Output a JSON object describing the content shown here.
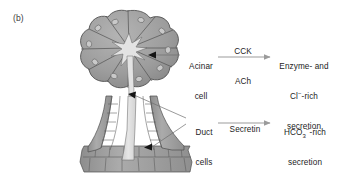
{
  "figure": {
    "panel_letter": "(b)",
    "diagram_title": "pancreatic-acinus-and-duct",
    "colors": {
      "acinus_fill": "#9a9a9a",
      "acinus_cell_fill": "#9e9e9e",
      "acinus_outline": "#4a4a4a",
      "nucleus_fill": "#c9c9c9",
      "lumen_fill": "#dedede",
      "duct_cell_fill": "#a5a5a5",
      "duct_outline": "#4f4f4f",
      "arrow_gray": "#9b9b9b",
      "leader_line": "#6e6e6e",
      "arrowhead_dark": "#151515",
      "text": "#1c1c1c",
      "background": "#ffffff"
    }
  },
  "labels": {
    "acinar_cell": {
      "line1": "Acinar",
      "line2": "cell"
    },
    "duct_cells": {
      "line1": "Duct",
      "line2": "cells"
    }
  },
  "stimuli": {
    "acinar": {
      "line1": "CCK",
      "line2": "ACh"
    },
    "duct": {
      "line1": "Secretin"
    }
  },
  "outputs": {
    "acinar_secretion": {
      "line1": "Enzyme- and",
      "line2_prefix": "Cl",
      "line2_charge": "−",
      "line2_suffix": "-rich",
      "line3": "secretion"
    },
    "duct_secretion": {
      "line1_prefix": "HCO",
      "line1_sub": "3",
      "line1_charge": "−",
      "line1_suffix": "-rich",
      "line2": "secretion"
    }
  },
  "structures": {
    "acinus": "acinus-lobed-cluster",
    "acinar_cells": "wedge-shaped-acinar-cells",
    "central_lumen": "star-shaped-acinar-lumen",
    "intercalated_duct": "vertical-intercalated-duct",
    "collecting_duct": "horizontal-collecting-duct",
    "nuclei": "acinar-cell-nuclei"
  }
}
